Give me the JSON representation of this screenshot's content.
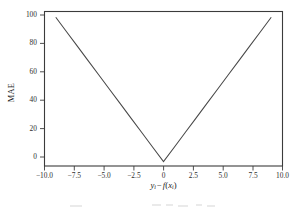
{
  "figure": {
    "background_color": "#ffffff",
    "line_color": "#474747",
    "axis_color": "#3b3b3b",
    "text_color": "#232323"
  },
  "axes": {
    "ylabel": "MAE",
    "xlabel_parts": {
      "y": "y",
      "y_sub": "i",
      "operator": "−",
      "f": "f",
      "open_paren": "(",
      "x": "x",
      "x_sub": "i",
      "close_paren": ")"
    },
    "xlabel_text": "yᵢ − f(xᵢ)",
    "xticks": [
      "−10.0",
      "−7.5",
      "−5.0",
      "−2.5",
      "0",
      "2.5",
      "5.0",
      "7.5",
      "10.0"
    ],
    "xtick_values": [
      -10,
      -7.5,
      -5,
      -2.5,
      0,
      2.5,
      5,
      7.5,
      10
    ],
    "yticks": [
      "0",
      "20",
      "40",
      "60",
      "80",
      "100"
    ],
    "ytick_values": [
      0,
      20,
      40,
      60,
      80,
      100
    ]
  },
  "chart_data": {
    "type": "line",
    "title": "",
    "xlabel": "yᵢ − f(xᵢ)",
    "ylabel": "MAE",
    "xlim": [
      -11.0,
      11.0
    ],
    "ylim": [
      -3.0,
      104.0
    ],
    "grid": false,
    "legend": null,
    "xticks": [
      -10,
      -7.5,
      -5,
      -2.5,
      0,
      2.5,
      5,
      7.5,
      10
    ],
    "yticks": [
      0,
      20,
      40,
      60,
      80,
      100
    ],
    "series": [
      {
        "name": "MAE",
        "formula": "10 * |y_i - f(x_i)|",
        "x": [
          -10,
          -9,
          -8,
          -7,
          -6,
          -5,
          -4,
          -3,
          -2,
          -1,
          0,
          1,
          2,
          3,
          4,
          5,
          6,
          7,
          8,
          9,
          10
        ],
        "values": [
          100,
          90,
          80,
          70,
          60,
          50,
          40,
          30,
          20,
          10,
          0,
          10,
          20,
          30,
          40,
          50,
          60,
          70,
          80,
          90,
          100
        ]
      }
    ]
  }
}
